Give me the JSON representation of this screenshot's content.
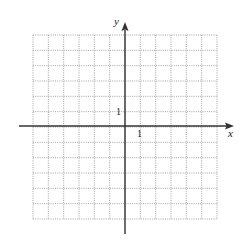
{
  "diagram": {
    "type": "coordinate-grid",
    "grid": {
      "columns": 12,
      "rows": 12,
      "x_min": -6,
      "x_max": 6,
      "y_min": -6,
      "y_max": 6,
      "line_style": "dotted",
      "line_color": "#9a9a9a"
    },
    "axes": {
      "x_label": "x",
      "y_label": "y",
      "x_tick_label": "1",
      "y_tick_label": "1",
      "color": "#333333"
    }
  }
}
